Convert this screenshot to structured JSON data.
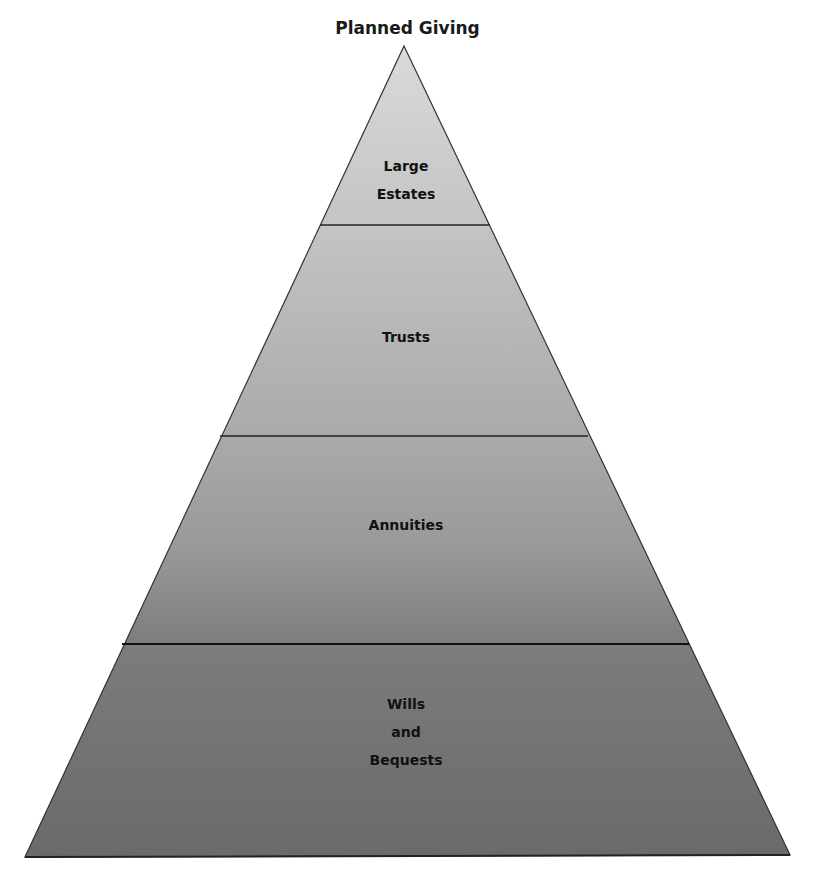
{
  "diagram": {
    "title": "Planned Giving",
    "type": "pyramid",
    "levels": [
      {
        "label_lines": [
          "Large",
          "Estates"
        ],
        "color": "#cfcfcf"
      },
      {
        "label_lines": [
          "Trusts"
        ],
        "color": "#b6b6b6"
      },
      {
        "label_lines": [
          "Annuities"
        ],
        "color": "#8f8f8f"
      },
      {
        "label_lines": [
          "Wills",
          "and",
          "Bequests"
        ],
        "color": "#6f6f6f"
      }
    ]
  },
  "labels": {
    "l0a": "Large",
    "l0b": "Estates",
    "l1": "Trusts",
    "l2": "Annuities",
    "l3a": "Wills",
    "l3b": "and",
    "l3c": "Bequests"
  }
}
